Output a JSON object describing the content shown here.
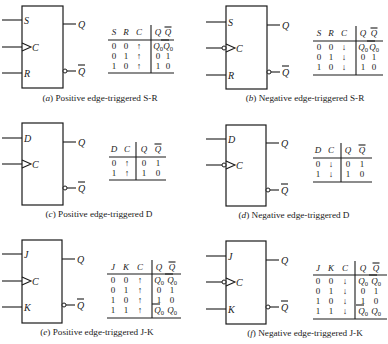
{
  "figure": {
    "panels": [
      {
        "id": "a",
        "caption": "(a) Positive edge-triggered S-R",
        "caption_letter": "a",
        "caption_text": "Positive edge-triggered S-R",
        "type": "SR",
        "edge": "positive",
        "box": {
          "x": 22,
          "y": 6,
          "w": 41,
          "h": 82
        },
        "inputs": [
          {
            "label": "S",
            "y": 20,
            "clock": false
          },
          {
            "label": "C",
            "y": 47,
            "clock": true
          },
          {
            "label": "R",
            "y": 73,
            "clock": false
          }
        ],
        "outputs": [
          {
            "label": "Q",
            "y": 24,
            "inverted": false
          },
          {
            "label": "Q̄",
            "y": 71,
            "inverted": true
          }
        ],
        "caption_pos": {
          "x": 100,
          "y": 101
        },
        "table": {
          "x": 108,
          "w": 66,
          "header_y": 35,
          "line_y": 40,
          "row_start_y": 49,
          "row_h": 10,
          "bottom_y": 73,
          "divider_x": 151,
          "columns": [
            "S",
            "R",
            "C",
            "Q",
            "Q̄"
          ],
          "col_x": [
            114,
            126,
            139,
            158,
            168
          ],
          "rows": [
            [
              "0",
              "0",
              "↑",
              "Q₀",
              "Q̄₀"
            ],
            [
              "0",
              "1",
              "↑",
              "0",
              "1"
            ],
            [
              "1",
              "0",
              "↑",
              "1",
              "0"
            ]
          ]
        }
      },
      {
        "id": "b",
        "caption": "(b) Negative edge-triggered S-R",
        "caption_letter": "b",
        "caption_text": "Negative edge-triggered S-R",
        "type": "SR",
        "edge": "negative",
        "box": {
          "x": 226,
          "y": 6,
          "w": 41,
          "h": 83
        },
        "inputs": [
          {
            "label": "S",
            "y": 22,
            "clock": false
          },
          {
            "label": "C",
            "y": 48,
            "clock": true
          },
          {
            "label": "R",
            "y": 75,
            "clock": false
          }
        ],
        "outputs": [
          {
            "label": "Q",
            "y": 25,
            "inverted": false
          },
          {
            "label": "Q̄",
            "y": 72,
            "inverted": true
          }
        ],
        "caption_pos": {
          "x": 305,
          "y": 101
        },
        "table": {
          "x": 313,
          "w": 70,
          "header_y": 36,
          "line_y": 41,
          "row_start_y": 50,
          "row_h": 10,
          "bottom_y": 75,
          "divider_x": 356,
          "columns": [
            "S",
            "R",
            "C",
            "Q",
            "Q̄"
          ],
          "col_x": [
            319,
            331,
            344,
            363,
            374
          ],
          "rows": [
            [
              "0",
              "0",
              "↓",
              "Q₀",
              "Q̄₀"
            ],
            [
              "0",
              "1",
              "↓",
              "0",
              "1"
            ],
            [
              "1",
              "0",
              "↓",
              "1",
              "0"
            ]
          ]
        }
      },
      {
        "id": "c",
        "caption": "(c) Positive edge-triggered D",
        "caption_letter": "c",
        "caption_text": "Positive edge-triggered D",
        "type": "D",
        "edge": "positive",
        "box": {
          "x": 22,
          "y": 123,
          "w": 41,
          "h": 82
        },
        "inputs": [
          {
            "label": "D",
            "y": 138,
            "clock": false
          },
          {
            "label": "C",
            "y": 164,
            "clock": true
          }
        ],
        "outputs": [
          {
            "label": "Q",
            "y": 142,
            "inverted": false
          },
          {
            "label": "Q̄",
            "y": 188,
            "inverted": true
          }
        ],
        "caption_pos": {
          "x": 99,
          "y": 217
        },
        "table": {
          "x": 109,
          "w": 57,
          "header_y": 152,
          "line_y": 157,
          "row_start_y": 166,
          "row_h": 10,
          "bottom_y": 180,
          "divider_x": 136,
          "columns": [
            "D",
            "C",
            "Q",
            "Q̄"
          ],
          "col_x": [
            114,
            127,
            144,
            158
          ],
          "rows": [
            [
              "0",
              "↑",
              "0",
              "1"
            ],
            [
              "1",
              "↑",
              "1",
              "0"
            ]
          ]
        }
      },
      {
        "id": "d",
        "caption": "(d) Negative edge-triggered D",
        "caption_letter": "d",
        "caption_text": "Negative edge-triggered D",
        "type": "D",
        "edge": "negative",
        "box": {
          "x": 226,
          "y": 125,
          "w": 40,
          "h": 81
        },
        "inputs": [
          {
            "label": "D",
            "y": 139,
            "clock": false
          },
          {
            "label": "C",
            "y": 165,
            "clock": true
          }
        ],
        "outputs": [
          {
            "label": "Q",
            "y": 143,
            "inverted": false
          },
          {
            "label": "Q̄",
            "y": 190,
            "inverted": true
          }
        ],
        "caption_pos": {
          "x": 294,
          "y": 218
        },
        "table": {
          "x": 313,
          "w": 59,
          "header_y": 153,
          "line_y": 158,
          "row_start_y": 167,
          "row_h": 10,
          "bottom_y": 182,
          "divider_x": 341,
          "columns": [
            "D",
            "C",
            "Q",
            "Q̄"
          ],
          "col_x": [
            318,
            331,
            348,
            362
          ],
          "rows": [
            [
              "0",
              "↓",
              "0",
              "1"
            ],
            [
              "1",
              "↓",
              "1",
              "0"
            ]
          ]
        }
      },
      {
        "id": "e",
        "caption": "(e) Positive edge-triggered J-K",
        "caption_letter": "e",
        "caption_text": "Positive edge-triggered J-K",
        "type": "JK",
        "edge": "positive",
        "box": {
          "x": 22,
          "y": 240,
          "w": 40,
          "h": 83
        },
        "inputs": [
          {
            "label": "J",
            "y": 254,
            "clock": false
          },
          {
            "label": "C",
            "y": 281,
            "clock": true
          },
          {
            "label": "K",
            "y": 307,
            "clock": false
          }
        ],
        "outputs": [
          {
            "label": "Q",
            "y": 259,
            "inverted": false
          },
          {
            "label": "Q̄",
            "y": 305,
            "inverted": true
          }
        ],
        "caption_pos": {
          "x": 97,
          "y": 335
        },
        "table": {
          "x": 107,
          "w": 74,
          "header_y": 270,
          "line_y": 274,
          "row_start_y": 283,
          "row_h": 10,
          "bottom_y": 318,
          "divider_x": 152,
          "columns": [
            "J",
            "K",
            "C",
            "Q",
            "Q̄"
          ],
          "col_x": [
            113,
            126,
            140,
            159,
            172
          ],
          "rows": [
            [
              "0",
              "0",
              "↑",
              "Q₀",
              "Q̄₀"
            ],
            [
              "0",
              "1",
              "↑",
              "0",
              "1"
            ],
            [
              "1",
              "0",
              "↑",
              "1",
              "0"
            ],
            [
              "1",
              "1",
              "↑",
              "Q̄₀",
              "Q₀"
            ]
          ]
        }
      },
      {
        "id": "f",
        "caption": "(f) Negative edge-triggered J-K",
        "caption_letter": "f",
        "caption_text": "Negative edge-triggered J-K",
        "type": "JK",
        "edge": "negative",
        "box": {
          "x": 226,
          "y": 241,
          "w": 40,
          "h": 83
        },
        "inputs": [
          {
            "label": "J",
            "y": 256,
            "clock": false
          },
          {
            "label": "C",
            "y": 282,
            "clock": true
          },
          {
            "label": "K",
            "y": 309,
            "clock": false
          }
        ],
        "outputs": [
          {
            "label": "Q",
            "y": 260,
            "inverted": false
          },
          {
            "label": "Q̄",
            "y": 307,
            "inverted": true
          }
        ],
        "caption_pos": {
          "x": 305,
          "y": 336
        },
        "table": {
          "x": 313,
          "w": 74,
          "header_y": 271,
          "line_y": 275,
          "row_start_y": 284,
          "row_h": 10,
          "bottom_y": 319,
          "divider_x": 355,
          "columns": [
            "J",
            "K",
            "C",
            "Q",
            "Q̄"
          ],
          "col_x": [
            318,
            331,
            345,
            363,
            376
          ],
          "rows": [
            [
              "0",
              "0",
              "↓",
              "Q₀",
              "Q̄₀"
            ],
            [
              "0",
              "1",
              "↓",
              "0",
              "1"
            ],
            [
              "1",
              "0",
              "↓",
              "1",
              "0"
            ],
            [
              "1",
              "1",
              "↓",
              "Q̄₀",
              "Q₀"
            ]
          ]
        }
      }
    ]
  },
  "colors": {
    "ink": "#1a1a1a",
    "background": "#ffffff"
  }
}
